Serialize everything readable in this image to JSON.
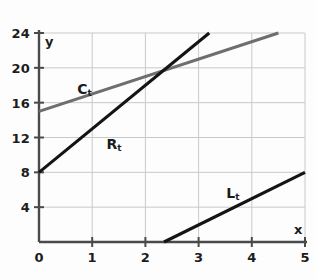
{
  "chart_data": {
    "type": "line",
    "title": "",
    "subtitle": "",
    "xlabel": "x",
    "ylabel": "y",
    "xlim": [
      0,
      5
    ],
    "ylim": [
      0,
      24
    ],
    "grid": true,
    "legend_position": "inline-labels",
    "x_ticks": [
      "0",
      "1",
      "2",
      "3",
      "4",
      "5"
    ],
    "x_tick_values": [
      0,
      1,
      2,
      3,
      4,
      5
    ],
    "y_ticks": [
      "4",
      "8",
      "12",
      "16",
      "20",
      "24"
    ],
    "y_tick_values": [
      4,
      8,
      12,
      16,
      20,
      24
    ],
    "series": [
      {
        "name": "C_t",
        "label": "C",
        "subscript": "t",
        "color": "#6e6e6e",
        "points": [
          [
            0,
            15
          ],
          [
            4.5,
            24
          ]
        ],
        "slope": 2,
        "intercept": 15,
        "label_x": 0.72,
        "label_y": 17.6
      },
      {
        "name": "R_t",
        "label": "R",
        "subscript": "t",
        "color": "#141414",
        "points": [
          [
            0,
            8
          ],
          [
            3.2,
            24
          ]
        ],
        "slope": 5,
        "intercept": 8,
        "label_x": 1.27,
        "label_y": 11.3
      },
      {
        "name": "L_t",
        "label": "L",
        "subscript": "t",
        "color": "#141414",
        "points": [
          [
            2.35,
            0
          ],
          [
            5,
            8
          ]
        ],
        "slope": 3.02,
        "intercept": -7.1,
        "label_x": 3.52,
        "label_y": 5.6
      }
    ],
    "axis_color": "#4a4a4a",
    "grid_color": "#c9c9c9",
    "background_color": "#fdfdfd"
  },
  "axes": {
    "y_title": "y",
    "x_title": "x",
    "origin_label": "0"
  }
}
